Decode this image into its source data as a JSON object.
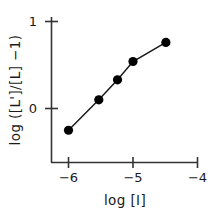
{
  "chart_data": {
    "type": "line",
    "title": "",
    "subtitle": "",
    "xlabel": "log [I]",
    "ylabel": "log ([L']/[L] −1)",
    "xlim": [
      -6.35,
      -3.75
    ],
    "ylim": [
      -0.55,
      1.2
    ],
    "xticks": [
      -6,
      -5,
      -4
    ],
    "xticklabels": [
      "−6",
      "−5",
      "−4"
    ],
    "yticks": [
      0,
      1
    ],
    "yticklabels": [
      "0",
      "1"
    ],
    "grid": false,
    "legend": null,
    "marker": "filled-circle",
    "marker_color": "#000000",
    "line_color": "#1a1a1a",
    "series": [
      {
        "name": "titration",
        "x": [
          -6.0,
          -5.53,
          -5.24,
          -5.0,
          -4.49
        ],
        "y": [
          -0.25,
          0.1,
          0.33,
          0.54,
          0.76
        ]
      }
    ],
    "annotations": []
  },
  "axes": {
    "spine_color": "#333333",
    "tick_mark_length": 6,
    "ticks_direction": "out"
  },
  "icons": {
    "data_point": "filled-circle-marker"
  }
}
